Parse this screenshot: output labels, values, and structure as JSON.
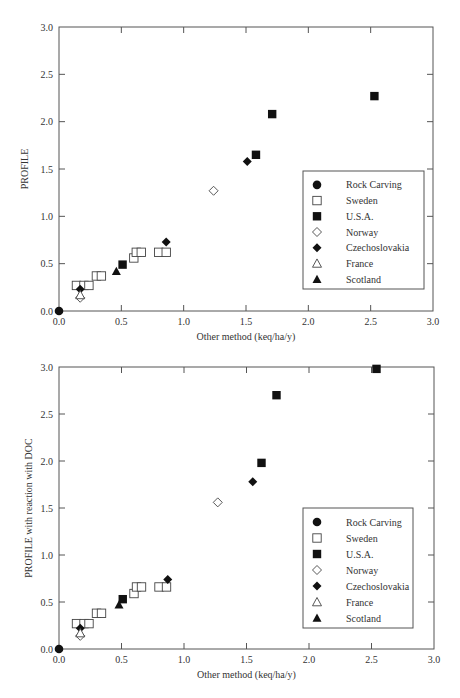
{
  "chart_data": [
    {
      "type": "scatter",
      "title": "",
      "xlabel": "Other method (keq/ha/y)",
      "ylabel": "PROFILE",
      "xlim": [
        0,
        3.0
      ],
      "ylim": [
        0,
        3.0
      ],
      "xticks": [
        "0.0",
        "0.5",
        "1.0",
        "1.5",
        "2.0",
        "2.5",
        "3.0"
      ],
      "yticks": [
        "0.0",
        "0.5",
        "1.0",
        "1.5",
        "2.0",
        "2.5",
        "3.0"
      ],
      "grid": false,
      "legend_position": "lower right",
      "series": [
        {
          "name": "Rock Carving",
          "marker": "filled-circle",
          "points": [
            [
              0.0,
              0.0
            ]
          ]
        },
        {
          "name": "Sweden",
          "marker": "open-square",
          "points": [
            [
              0.14,
              0.27
            ],
            [
              0.2,
              0.27
            ],
            [
              0.24,
              0.27
            ],
            [
              0.3,
              0.37
            ],
            [
              0.34,
              0.37
            ],
            [
              0.6,
              0.56
            ],
            [
              0.62,
              0.62
            ],
            [
              0.66,
              0.62
            ],
            [
              0.8,
              0.62
            ],
            [
              0.86,
              0.62
            ]
          ]
        },
        {
          "name": "U.S.A.",
          "marker": "filled-square",
          "points": [
            [
              0.51,
              0.49
            ],
            [
              1.58,
              1.65
            ],
            [
              1.71,
              2.08
            ],
            [
              2.53,
              2.27
            ]
          ]
        },
        {
          "name": "Norway",
          "marker": "open-diamond",
          "points": [
            [
              0.17,
              0.14
            ],
            [
              1.24,
              1.27
            ]
          ]
        },
        {
          "name": "Czechoslovakia",
          "marker": "filled-diamond",
          "points": [
            [
              0.17,
              0.23
            ],
            [
              0.86,
              0.73
            ],
            [
              1.51,
              1.58
            ]
          ]
        },
        {
          "name": "France",
          "marker": "open-triangle",
          "points": [
            [
              0.17,
              0.17
            ]
          ]
        },
        {
          "name": "Scotland",
          "marker": "filled-triangle",
          "points": [
            [
              0.46,
              0.42
            ]
          ]
        }
      ]
    },
    {
      "type": "scatter",
      "title": "",
      "xlabel": "Other method (keq/ha/y)",
      "ylabel": "PROFILE with reaction with DOC",
      "xlim": [
        0,
        3.0
      ],
      "ylim": [
        0,
        3.0
      ],
      "xticks": [
        "0.0",
        "0.5",
        "1.0",
        "1.5",
        "2.0",
        "2.5",
        "3.0"
      ],
      "yticks": [
        "0.0",
        "0.5",
        "1.0",
        "1.5",
        "2.0",
        "2.5",
        "3.0"
      ],
      "grid": false,
      "legend_position": "lower right",
      "series": [
        {
          "name": "Rock Carving",
          "marker": "filled-circle",
          "points": [
            [
              0.0,
              0.0
            ]
          ]
        },
        {
          "name": "Sweden",
          "marker": "open-square",
          "points": [
            [
              0.14,
              0.27
            ],
            [
              0.2,
              0.27
            ],
            [
              0.24,
              0.27
            ],
            [
              0.3,
              0.38
            ],
            [
              0.34,
              0.38
            ],
            [
              0.6,
              0.59
            ],
            [
              0.62,
              0.66
            ],
            [
              0.66,
              0.66
            ],
            [
              0.8,
              0.66
            ],
            [
              0.86,
              0.66
            ]
          ]
        },
        {
          "name": "U.S.A.",
          "marker": "filled-square",
          "points": [
            [
              0.51,
              0.53
            ],
            [
              1.62,
              1.98
            ],
            [
              1.74,
              2.7
            ],
            [
              2.54,
              2.98
            ]
          ]
        },
        {
          "name": "Norway",
          "marker": "open-diamond",
          "points": [
            [
              0.17,
              0.14
            ],
            [
              1.27,
              1.56
            ]
          ]
        },
        {
          "name": "Czechoslovakia",
          "marker": "filled-diamond",
          "points": [
            [
              0.17,
              0.22
            ],
            [
              0.87,
              0.74
            ],
            [
              1.55,
              1.78
            ]
          ]
        },
        {
          "name": "France",
          "marker": "open-triangle",
          "points": [
            [
              0.17,
              0.17
            ]
          ]
        },
        {
          "name": "Scotland",
          "marker": "filled-triangle",
          "points": [
            [
              0.48,
              0.47
            ]
          ]
        }
      ]
    }
  ],
  "charts": [
    {
      "xlabel": "Other method (keq/ha/y)",
      "ylabel": "PROFILE",
      "legend": [
        "Rock Carving",
        "Sweden",
        "U.S.A.",
        "Norway",
        "Czechoslovakia",
        "France",
        "Scotland"
      ]
    },
    {
      "xlabel": "Other method (keq/ha/y)",
      "ylabel": "PROFILE with reaction with DOC",
      "legend": [
        "Rock Carving",
        "Sweden",
        "U.S.A.",
        "Norway",
        "Czechoslovakia",
        "France",
        "Scotland"
      ]
    }
  ],
  "colors": {
    "axis": "#555555",
    "marker": "#111111",
    "text": "#333333"
  }
}
